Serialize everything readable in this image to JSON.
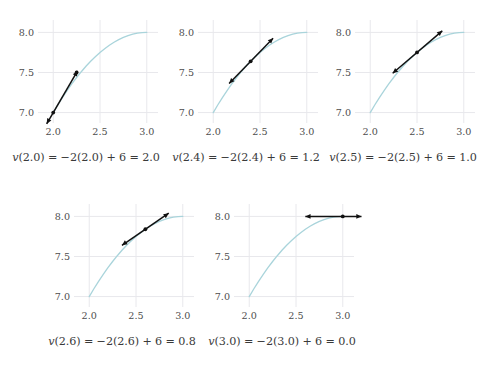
{
  "figure": {
    "title": "",
    "panel_count": 5,
    "background_color": "#ffffff",
    "curve_color": "#a9d4db",
    "tangent_color": "#111111",
    "grid_color": "#e8e8ec",
    "tick_label_color": "#4d4d4d",
    "caption_color": "#3a3a3a"
  },
  "chart_data": {
    "type": "line",
    "title": "",
    "xlabel": "",
    "ylabel": "",
    "xlim": [
      1.88,
      3.12
    ],
    "ylim": [
      6.92,
      8.08
    ],
    "xticks": [
      "2.0",
      "2.5",
      "3.0"
    ],
    "xtick_values": [
      2.0,
      2.5,
      3.0
    ],
    "yticks": [
      "7.0",
      "7.5",
      "8.0"
    ],
    "ytick_values": [
      7.0,
      7.5,
      8.0
    ],
    "grid": true,
    "legend": "none",
    "shared_curve": {
      "name": "s(t)",
      "description": "position curve rising from 7.0 at t=2.0 and flattening to 8.0 near t=3.0",
      "x": [
        2.0,
        2.05,
        2.1,
        2.15,
        2.2,
        2.25,
        2.3,
        2.35,
        2.4,
        2.45,
        2.5,
        2.55,
        2.6,
        2.65,
        2.7,
        2.75,
        2.8,
        2.85,
        2.9,
        2.95,
        3.0
      ],
      "y": [
        7.0,
        7.0975,
        7.19,
        7.2775,
        7.36,
        7.4375,
        7.51,
        7.5775,
        7.64,
        7.6975,
        7.75,
        7.7975,
        7.84,
        7.8775,
        7.91,
        7.9375,
        7.96,
        7.9775,
        7.99,
        7.9975,
        8.0
      ]
    },
    "panels": [
      {
        "index": 0,
        "caption": "v(2.0) = −2(2.0) + 6 = 2.0",
        "caption_parts": {
          "fn": "v",
          "arg": "2.0",
          "slope_expr": "−2(2.0) + 6",
          "result": "2.0"
        },
        "tangent": {
          "point_x": 2.0,
          "point_y": 7.0,
          "slope": 2.0,
          "x_start": 1.93,
          "x_end": 2.26,
          "marker_points": [
            [
              2.0,
              7.0
            ],
            [
              2.25,
              7.5
            ]
          ]
        }
      },
      {
        "index": 1,
        "caption": "v(2.4) = −2(2.4) + 6 = 1.2",
        "caption_parts": {
          "fn": "v",
          "arg": "2.4",
          "slope_expr": "−2(2.4) + 6",
          "result": "1.2"
        },
        "tangent": {
          "point_x": 2.4,
          "point_y": 7.64,
          "slope": 1.2,
          "x_start": 2.17,
          "x_end": 2.64,
          "marker_points": [
            [
              2.4,
              7.64
            ]
          ]
        }
      },
      {
        "index": 2,
        "caption": "v(2.5) = −2(2.5) + 6 = 1.0",
        "caption_parts": {
          "fn": "v",
          "arg": "2.5",
          "slope_expr": "−2(2.5) + 6",
          "result": "1.0"
        },
        "tangent": {
          "point_x": 2.5,
          "point_y": 7.75,
          "slope": 1.0,
          "x_start": 2.24,
          "x_end": 2.77,
          "marker_points": [
            [
              2.5,
              7.75
            ]
          ]
        }
      },
      {
        "index": 3,
        "caption": "v(2.6) = −2(2.6) + 6 = 0.8",
        "caption_parts": {
          "fn": "v",
          "arg": "2.6",
          "slope_expr": "−2(2.6) + 6",
          "result": "0.8"
        },
        "tangent": {
          "point_x": 2.6,
          "point_y": 7.84,
          "slope": 0.8,
          "x_start": 2.35,
          "x_end": 2.85,
          "marker_points": [
            [
              2.6,
              7.84
            ]
          ]
        }
      },
      {
        "index": 4,
        "caption": "v(3.0) = −2(3.0) + 6 = 0.0",
        "caption_parts": {
          "fn": "v",
          "arg": "3.0",
          "slope_expr": "−2(3.0) + 6",
          "result": "0.0"
        },
        "tangent": {
          "point_x": 3.0,
          "point_y": 8.0,
          "slope": 0.0,
          "x_start": 2.6,
          "x_end": 3.2,
          "marker_points": [
            [
              3.0,
              8.0
            ]
          ]
        }
      }
    ]
  }
}
